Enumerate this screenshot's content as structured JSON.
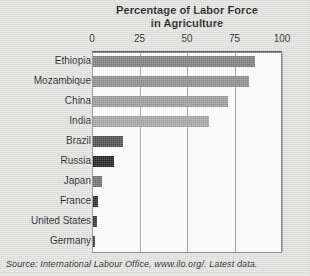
{
  "chart_data": {
    "type": "bar",
    "orientation": "horizontal",
    "title": "Percentage of Labor Force in Agriculture",
    "title_line1": "Percentage of Labor Force",
    "title_line2": "in Agriculture",
    "xlabel": "",
    "ylabel": "",
    "xlim": [
      0,
      100
    ],
    "ticks": [
      {
        "label": "0",
        "value": 0
      },
      {
        "label": "25",
        "value": 25
      },
      {
        "label": "50",
        "value": 50
      },
      {
        "label": "75",
        "value": 75
      },
      {
        "label": "100",
        "value": 100
      }
    ],
    "grid": "vertical",
    "legend": "none",
    "categories": [
      "Ethiopia",
      "Mozambique",
      "China",
      "India",
      "Brazil",
      "Russia",
      "Japan",
      "France",
      "United States",
      "Germany"
    ],
    "values": [
      85,
      82,
      71,
      61,
      16,
      11,
      4.5,
      2.5,
      2.2,
      1.3
    ],
    "bars": [
      {
        "label": "Ethiopia",
        "value": 85,
        "color": "#7d7d7d"
      },
      {
        "label": "Mozambique",
        "value": 82,
        "color": "#8c8c8c"
      },
      {
        "label": "China",
        "value": 71,
        "color": "#9a9a9a"
      },
      {
        "label": "India",
        "value": 61,
        "color": "#a3a3a3"
      },
      {
        "label": "Brazil",
        "value": 16,
        "color": "#4a4a4a"
      },
      {
        "label": "Russia",
        "value": 11,
        "color": "#1f1f1f"
      },
      {
        "label": "Japan",
        "value": 4.5,
        "color": "#6f6f6f"
      },
      {
        "label": "France",
        "value": 2.5,
        "color": "#2b2b2b"
      },
      {
        "label": "United States",
        "value": 2.2,
        "color": "#333333"
      },
      {
        "label": "Germany",
        "value": 1.3,
        "color": "#3a3a3a"
      }
    ],
    "source": "Source: International Labour Office, www.ilo.org/. Latest data.",
    "colors": {
      "page_background": "#e3e3e1",
      "plot_background": "#ffffff",
      "gridline": "#9b9b9b",
      "frame": "#8a8a8a",
      "text": "#1a1a1a"
    }
  }
}
